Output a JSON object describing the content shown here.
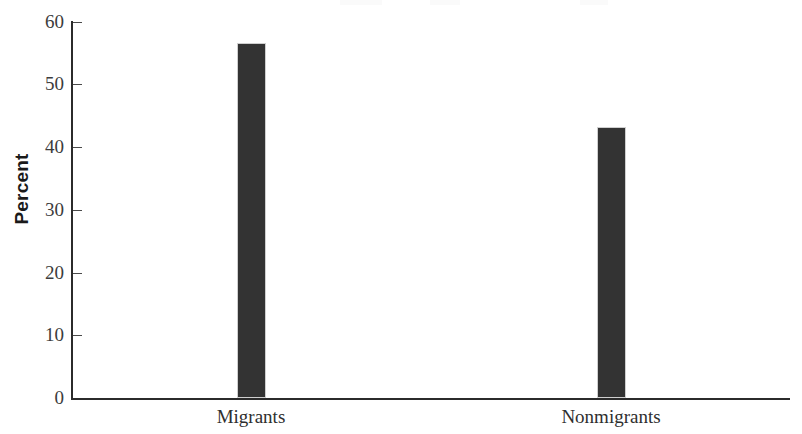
{
  "chart_data": {
    "type": "bar",
    "title": "",
    "subtitle": "",
    "xlabel": "",
    "ylabel": "Percent",
    "categories": [
      "Migrants",
      "Nonmigrants"
    ],
    "values": [
      56.6,
      43.2
    ],
    "series": [
      {
        "name": "Percent",
        "values": [
          56.6,
          43.2
        ]
      }
    ],
    "ylim": [
      0,
      60
    ],
    "y_ticks": [
      0,
      10,
      20,
      30,
      40,
      50,
      60
    ],
    "y_tick_labels": [
      "0",
      "10",
      "20",
      "30",
      "40",
      "50",
      "60"
    ],
    "grid": false,
    "legend": false,
    "legend_position": "none",
    "bar_color": "#333333",
    "axis_color": "#2b2b2b",
    "tick_direction": "in",
    "annotations": []
  },
  "axis": {
    "y_title": "Percent"
  }
}
